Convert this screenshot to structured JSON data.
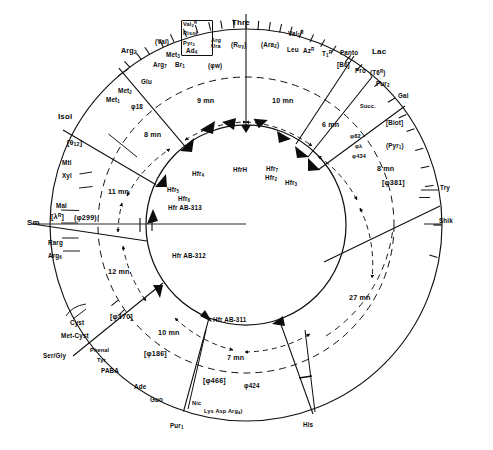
{
  "figure": {
    "type": "circular-genetic-map",
    "units": "mn (minutes)"
  },
  "outer_markers": [
    {
      "id": "arg2",
      "label": "Arg",
      "sub": "2"
    },
    {
      "id": "met3",
      "label": "Met",
      "sub": "3"
    },
    {
      "id": "ad4",
      "label": "Ad",
      "sub": "4"
    },
    {
      "id": "arg7",
      "label": "Arg",
      "sub": "7"
    },
    {
      "id": "br1",
      "label": "Br",
      "sub": "1"
    },
    {
      "id": "glu",
      "label": "Glu"
    },
    {
      "id": "met2",
      "label": "Met",
      "sub": "2"
    },
    {
      "id": "met1",
      "label": "Met",
      "sub": "1"
    },
    {
      "id": "phi18",
      "label": "φ18"
    },
    {
      "id": "isol",
      "label": "Isol"
    },
    {
      "id": "theta12",
      "label": "[θ",
      "sub": "12",
      "tail": "]"
    },
    {
      "id": "mtl",
      "label": "Mtl"
    },
    {
      "id": "xyl",
      "label": "Xyl"
    },
    {
      "id": "mal",
      "label": "Mal"
    },
    {
      "id": "lambdaR",
      "label": "[λ",
      "sup": "R",
      "tail": "]"
    },
    {
      "id": "phi299",
      "label": "(φ299)"
    },
    {
      "id": "sm",
      "label": "Sm"
    },
    {
      "id": "rarg",
      "label": "Rarg"
    },
    {
      "id": "arg6",
      "label": "Arg",
      "sub": "6"
    },
    {
      "id": "cyst",
      "label": "Cyst"
    },
    {
      "id": "metcyst",
      "label": "Met-Cyst"
    },
    {
      "id": "phi370",
      "label": "[φ370]"
    },
    {
      "id": "sergly",
      "label": "Ser/Gly"
    },
    {
      "id": "phenal",
      "label": "Phenal"
    },
    {
      "id": "tyr",
      "label": "Tyr"
    },
    {
      "id": "paba",
      "label": "PABA"
    },
    {
      "id": "phi186",
      "label": "[φ186]"
    },
    {
      "id": "ade",
      "label": "Ade"
    },
    {
      "id": "guo",
      "label": "Guo"
    },
    {
      "id": "nic",
      "label": "Nic"
    },
    {
      "id": "lys",
      "label": "Lys"
    },
    {
      "id": "asp",
      "label": "Asp"
    },
    {
      "id": "arg4",
      "label": "Arg",
      "sub": "4",
      "tail": ")"
    },
    {
      "id": "pur1",
      "label": "Pur",
      "sub": "1"
    },
    {
      "id": "phi466",
      "label": "[φ466]"
    },
    {
      "id": "phi424",
      "label": "φ424"
    },
    {
      "id": "his",
      "label": "His"
    },
    {
      "id": "shik",
      "label": "Shik"
    },
    {
      "id": "try",
      "label": "Try"
    },
    {
      "id": "phi381",
      "label": "[φ381]"
    },
    {
      "id": "pyr1",
      "label": "(Pyr",
      "sub": "1",
      "tail": ")"
    },
    {
      "id": "phi434",
      "label": "φ434"
    },
    {
      "id": "philambda",
      "label": "φλ"
    },
    {
      "id": "phi82",
      "label": "φ82"
    },
    {
      "id": "biot",
      "label": "[Biot]"
    },
    {
      "id": "gal",
      "label": "Gal"
    },
    {
      "id": "succ",
      "label": "Succ."
    },
    {
      "id": "pur2",
      "label": "Pur",
      "sub": "2"
    },
    {
      "id": "t6r",
      "label": "(T6",
      "sup": "R",
      "tail": ")"
    },
    {
      "id": "lac",
      "label": "Lac"
    },
    {
      "id": "pro",
      "label": "Pro"
    },
    {
      "id": "b6",
      "label": "[B6]"
    },
    {
      "id": "panto",
      "label": "Panto"
    },
    {
      "id": "t1r",
      "label": "T",
      "sub": "1",
      "sup": "R"
    },
    {
      "id": "azr",
      "label": "Az",
      "sup": "R"
    },
    {
      "id": "leu",
      "label": "Leu"
    },
    {
      "id": "val1r",
      "label": "Val",
      "sub": "1",
      "sup": "R"
    },
    {
      "id": "ara2",
      "label": "(Ara",
      "sub": "2",
      "tail": ")"
    },
    {
      "id": "rtry",
      "label": "(R",
      "sub": "try",
      "tail": ")"
    },
    {
      "id": "thre",
      "label": "Thre"
    },
    {
      "id": "argura",
      "label": "Arg/Ura"
    },
    {
      "id": "valbox",
      "label": "[Val2R Risol Pyr2]"
    },
    {
      "id": "val",
      "label": "(Val)"
    },
    {
      "id": "phiw",
      "label": "(φw)"
    }
  ],
  "labels": {
    "arg2": "Arg",
    "arg2_sub": "2",
    "met3": "Met",
    "met3_sub": "3",
    "ad4": "Ad",
    "ad4_sub": "4",
    "arg7": "Arg",
    "arg7_sub": "7",
    "br1": "Br",
    "br1_sub": "1",
    "glu": "Glu",
    "met2": "Met",
    "met2_sub": "2",
    "met1": "Met",
    "met1_sub": "1",
    "phi18": "φ18",
    "isol": "Isol",
    "theta12_a": "[θ",
    "theta12_b": "12",
    "theta12_c": "]",
    "mtl": "Mtl",
    "xyl": "Xyl",
    "mal": "Mal",
    "lambdaR_a": "[λ",
    "lambdaR_b": "R",
    "lambdaR_c": "]",
    "phi299": "(φ299)",
    "sm": "Sm",
    "rarg": "Rarg",
    "arg6": "Arg",
    "arg6_sub": "6",
    "cyst": "Cyst",
    "metcyst": "Met-Cyst",
    "phi370": "[φ370]",
    "sergly": "Ser/Gly",
    "phenal": "Phenal",
    "tyr": "Tyr",
    "paba": "PABA",
    "phi186": "[φ186]",
    "ade": "Ade",
    "guo": "Guo",
    "nic": "Nic",
    "lysaspar_a": "Lys Asp Arg",
    "lysaspar_b": "4",
    "lysaspar_c": ")",
    "pur1": "Pur",
    "pur1_sub": "1",
    "phi466": "[φ466]",
    "phi424": "φ424",
    "his": "His",
    "shik": "Shik",
    "try": "Try",
    "phi381": "[φ381]",
    "pyr1_a": "(Pyr",
    "pyr1_b": "1",
    "pyr1_c": ")",
    "phi434": "φ434",
    "philambda": "φλ",
    "phi82": "φ82",
    "biot": "[Biot]",
    "gal": "Gal",
    "succ": "Succ.",
    "pur2": "Pur",
    "pur2_sub": "2",
    "t6r_a": "(T6",
    "t6r_b": "R",
    "t6r_c": ")",
    "lac": "Lac",
    "pro": "Pro",
    "b6": "[B6]",
    "panto": "Panto",
    "t1r_a": "T",
    "t1r_b": "1",
    "t1r_c": "R",
    "azr_a": "Az",
    "azr_b": "R",
    "leu": "Leu",
    "val1r_a": "Val",
    "val1r_b": "1",
    "val1r_c": "R",
    "ara2_a": "(Ara",
    "ara2_b": "2",
    "ara2_c": ")",
    "rtry_a": "(R",
    "rtry_b": "try",
    "rtry_c": ")",
    "thre": "Thre",
    "arg_ura_a": "Arg",
    "arg_ura_b": "Ura",
    "valbox_1a": "Val",
    "valbox_1b": "2",
    "valbox_1c": "R",
    "valbox_2": "Risol",
    "valbox_3a": "Pyr",
    "valbox_3b": "2",
    "val": "(Val)",
    "phiw": "(φw)"
  },
  "hfr_origins": [
    {
      "id": "hfrH",
      "label": "HfrH",
      "time": null
    },
    {
      "id": "hfr4",
      "label": "Hfr",
      "sub": "4"
    },
    {
      "id": "hfr5",
      "label": "Hfr",
      "sub": "5"
    },
    {
      "id": "hfr6",
      "label": "Hfr",
      "sub": "6"
    },
    {
      "id": "hfrAB313",
      "label": "Hfr AB-313"
    },
    {
      "id": "hfrAB312",
      "label": "Hfr AB-312"
    },
    {
      "id": "hfrAB311",
      "label": "Hfr AB-311"
    },
    {
      "id": "hfr7",
      "label": "Hfr",
      "sub": "7"
    },
    {
      "id": "hfr2",
      "label": "Hfr",
      "sub": "2"
    },
    {
      "id": "hfr3",
      "label": "Hfr",
      "sub": "3"
    }
  ],
  "hfr_labels": {
    "hfrH": "HfrH",
    "hfr4": "Hfr",
    "hfr4_sub": "4",
    "hfr5": "Hfr",
    "hfr5_sub": "5",
    "hfr6": "Hfr",
    "hfr6_sub": "6",
    "hfrAB313": "Hfr AB-313",
    "hfrAB312": "Hfr AB-312",
    "hfrAB311": "Hfr AB-311",
    "hfr7": "Hfr",
    "hfr7_sub": "7",
    "hfr2": "Hfr",
    "hfr2_sub": "2",
    "hfr3": "Hfr",
    "hfr3_sub": "3"
  },
  "time_annotations": {
    "t9": "9 mn",
    "t10_top": "10 mn",
    "t8_left": "8 mn",
    "t11": "11 mn",
    "t12": "12 mn",
    "t10_bottom": "10 mn",
    "t7": "7 mn",
    "t27": "27 mn",
    "t6": "6 mn",
    "t8_right": "8 mn"
  },
  "colors": {
    "ink": "#0d0d0d",
    "paper": "#ffffff",
    "rule": "#1a1a1a"
  }
}
